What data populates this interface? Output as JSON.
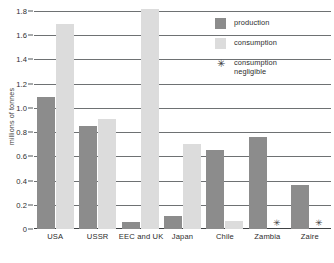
{
  "chart_data": {
    "type": "bar",
    "title": "",
    "xlabel": "",
    "ylabel": "millions of tonnes",
    "ylim": [
      0,
      1.8
    ],
    "ytick_labels": [
      "0",
      "0.2",
      "0.4",
      "0.6",
      "0.8",
      "1.0",
      "1.2",
      "1.4",
      "1.6",
      "1.8"
    ],
    "ytick_values": [
      0,
      0.2,
      0.4,
      0.6,
      0.8,
      1.0,
      1.2,
      1.4,
      1.6,
      1.8
    ],
    "grid": true,
    "legend_position": "top-right",
    "categories": [
      "USA",
      "USSR",
      "EEC and UK",
      "Japan",
      "Chile",
      "Zambia",
      "Zaire"
    ],
    "series": [
      {
        "name": "production",
        "color": "#8c8c8c",
        "values": [
          1.09,
          0.85,
          0.055,
          0.11,
          0.65,
          0.76,
          0.36
        ]
      },
      {
        "name": "consumption",
        "color": "#dcdcdc",
        "values": [
          1.69,
          0.91,
          1.82,
          0.7,
          0.07,
          null,
          null
        ]
      }
    ],
    "annotations": [
      {
        "category": "Zambia",
        "series": "consumption",
        "marker": "*",
        "meaning": "consumption negligible"
      },
      {
        "category": "Zaire",
        "series": "consumption",
        "marker": "*",
        "meaning": "consumption negligible"
      }
    ]
  },
  "axes": {
    "y_label": "millions of tonnes",
    "y_ticks": [
      {
        "label": "1.8",
        "value": 1.8
      },
      {
        "label": "1.6",
        "value": 1.6
      },
      {
        "label": "1.4",
        "value": 1.4
      },
      {
        "label": "1.2",
        "value": 1.2
      },
      {
        "label": "1.0",
        "value": 1.0
      },
      {
        "label": "0.8",
        "value": 0.8
      },
      {
        "label": "0.6",
        "value": 0.6
      },
      {
        "label": "0.4",
        "value": 0.4
      },
      {
        "label": "0.2",
        "value": 0.2
      },
      {
        "label": "0",
        "value": 0
      }
    ],
    "x_ticks": [
      {
        "label": "USA"
      },
      {
        "label": "USSR"
      },
      {
        "label": "EEC and UK"
      },
      {
        "label": "Japan"
      },
      {
        "label": "Chile"
      },
      {
        "label": "Zambia"
      },
      {
        "label": "Zaire"
      }
    ]
  },
  "legend": {
    "items": [
      {
        "label": "production",
        "swatch": "production",
        "marker": ""
      },
      {
        "label": "consumption",
        "swatch": "consumption",
        "marker": ""
      },
      {
        "label": "consumption negligible",
        "swatch": "negligible",
        "marker": "✳"
      }
    ]
  },
  "markers": {
    "negligible_symbol": "✳"
  },
  "colors": {
    "production": "#8c8c8c",
    "consumption": "#dcdcdc",
    "gridline": "#6e7173",
    "axis": "#3f4244",
    "text": "#2b2b2b"
  }
}
